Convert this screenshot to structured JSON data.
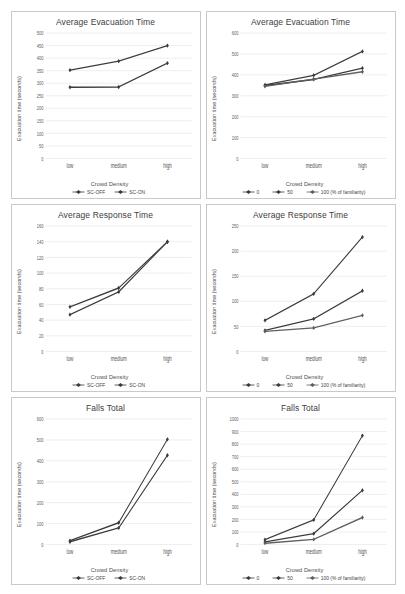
{
  "page": {
    "layout": "2x3 grid of line charts",
    "rows": 3,
    "cols": 2
  },
  "common": {
    "xlabel": "Crowd Density",
    "ylabel": "Evacuation time (seconds)",
    "categories": [
      "low",
      "medium",
      "high"
    ],
    "line_color": "#3b3b3b",
    "line_color_alt": "#5e5e5e",
    "grid_color": "#d6d6d6"
  },
  "charts": [
    {
      "id": "avg-evac-sc",
      "chart_data": {
        "type": "line",
        "title": "Average Evacuation Time",
        "xlabel": "Crowd Density",
        "ylabel": "Evacuation time (seconds)",
        "categories": [
          "low",
          "medium",
          "high"
        ],
        "ylim": [
          0,
          500
        ],
        "yticks": [
          0,
          50,
          100,
          150,
          200,
          250,
          300,
          350,
          400,
          450,
          500
        ],
        "grid": true,
        "legend_position": "bottom",
        "series": [
          {
            "name": "SC-OFF",
            "values": [
              352,
              388,
              450
            ]
          },
          {
            "name": "SC-ON",
            "values": [
              284,
              285,
              380
            ]
          }
        ]
      }
    },
    {
      "id": "avg-evac-fam",
      "chart_data": {
        "type": "line",
        "title": "Average Evacuation Time",
        "xlabel": "Crowd Density",
        "ylabel": "Evacuation time (seconds)",
        "categories": [
          "low",
          "medium",
          "high"
        ],
        "ylim": [
          0,
          600
        ],
        "yticks": [
          0,
          100,
          200,
          300,
          400,
          500,
          600
        ],
        "grid": true,
        "legend_position": "bottom",
        "series": [
          {
            "name": "0",
            "values": [
              352,
              398,
              512
            ]
          },
          {
            "name": "50",
            "values": [
              349,
              378,
              432
            ]
          },
          {
            "name": "100 (% of familiarity)",
            "values": [
              345,
              380,
              415
            ]
          }
        ]
      }
    },
    {
      "id": "avg-resp-sc",
      "chart_data": {
        "type": "line",
        "title": "Average Response Time",
        "xlabel": "Crowd Density",
        "ylabel": "Evacuation time (seconds)",
        "categories": [
          "low",
          "medium",
          "high"
        ],
        "ylim": [
          0,
          160
        ],
        "yticks": [
          0,
          20,
          40,
          60,
          80,
          100,
          120,
          140,
          160
        ],
        "grid": true,
        "legend_position": "bottom",
        "series": [
          {
            "name": "SC-OFF",
            "values": [
              57,
              81,
              140
            ]
          },
          {
            "name": "SC-ON",
            "values": [
              47,
              76,
              140
            ]
          }
        ]
      }
    },
    {
      "id": "avg-resp-fam",
      "chart_data": {
        "type": "line",
        "title": "Average Response Time",
        "xlabel": "Crowd Density",
        "ylabel": "Evacuation time (seconds)",
        "categories": [
          "low",
          "medium",
          "high"
        ],
        "ylim": [
          0,
          250
        ],
        "yticks": [
          0,
          50,
          100,
          150,
          200,
          250
        ],
        "grid": true,
        "legend_position": "bottom",
        "series": [
          {
            "name": "0",
            "values": [
              62,
              115,
              228
            ]
          },
          {
            "name": "50",
            "values": [
              42,
              65,
              121
            ]
          },
          {
            "name": "100 (% of familiarity)",
            "values": [
              40,
              47,
              72
            ]
          }
        ]
      }
    },
    {
      "id": "falls-sc",
      "chart_data": {
        "type": "line",
        "title": "Falls Total",
        "xlabel": "Crowd Density",
        "ylabel": "Evacuation time (seconds)",
        "categories": [
          "low",
          "medium",
          "high"
        ],
        "ylim": [
          0,
          600
        ],
        "yticks": [
          0,
          100,
          200,
          300,
          400,
          500,
          600
        ],
        "grid": true,
        "legend_position": "bottom",
        "series": [
          {
            "name": "SC-OFF",
            "values": [
              18,
              104,
              503
            ]
          },
          {
            "name": "SC-ON",
            "values": [
              13,
              79,
              427
            ]
          }
        ]
      }
    },
    {
      "id": "falls-fam",
      "chart_data": {
        "type": "line",
        "title": "Falls Total",
        "xlabel": "Crowd Density",
        "ylabel": "Evacuation time (seconds)",
        "categories": [
          "low",
          "medium",
          "high"
        ],
        "ylim": [
          0,
          1000
        ],
        "yticks": [
          0,
          100,
          200,
          300,
          400,
          500,
          600,
          700,
          800,
          900,
          1000
        ],
        "grid": true,
        "legend_position": "bottom",
        "series": [
          {
            "name": "0",
            "values": [
              38,
              196,
              868
            ]
          },
          {
            "name": "50",
            "values": [
              20,
              86,
              432
            ]
          },
          {
            "name": "100 (% of familiarity)",
            "values": [
              10,
              40,
              215
            ]
          }
        ]
      }
    }
  ]
}
